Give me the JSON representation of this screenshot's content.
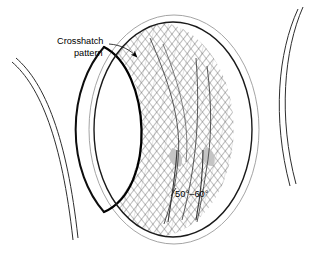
{
  "figure": {
    "background_color": "#ffffff"
  },
  "labels": {
    "crosshatch": {
      "line1": "Crosshatch",
      "line2": "pattern",
      "x": 57,
      "y": 44
    },
    "angle_annotation": {
      "text": "50°–60°",
      "x": 172,
      "y": 194
    }
  },
  "geometry": {
    "outer_ellipse": {
      "cx": 174,
      "cy": 129.5,
      "rx": 85,
      "ry": 114.5,
      "stroke": "#9a9a9a",
      "width": 0.9
    },
    "inner_ellipse": {
      "cx": 173,
      "cy": 129.5,
      "rx": 79,
      "ry": 107.5,
      "stroke": "#1a1a1a",
      "width": 1.5
    },
    "lens_boundary": {
      "stroke": "#000000",
      "width": 2.2,
      "description": "thick dark arc bounding white crescent on left"
    },
    "pipe_arcs_left": {
      "count": 2,
      "stroke": "#2b2b2b",
      "width": 1.0
    },
    "pipe_arcs_right": {
      "count": 2,
      "stroke": "#2b2b2b",
      "width": 1.0
    },
    "grey_blobs": {
      "count": 2,
      "fill": "#c0c0c0",
      "positions": [
        [
          178,
          158
        ],
        [
          208,
          157
        ]
      ]
    },
    "hatch": {
      "stroke": "#444444",
      "spacing": 6,
      "angles": [
        38,
        -38
      ],
      "width": 0.65
    }
  },
  "colors": {
    "ink": "#000000",
    "hatch": "#444444",
    "outline_light": "#9a9a9a",
    "outline_dark": "#1a1a1a",
    "blob_grey": "#c0c0c0",
    "background": "#ffffff"
  },
  "icons": {
    "leader_arrow": "arrow-head-icon"
  }
}
